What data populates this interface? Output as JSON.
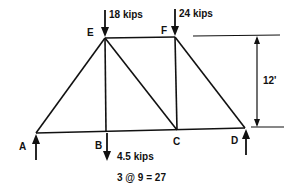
{
  "diagram": {
    "type": "truss",
    "nodes": {
      "A": {
        "label": "A"
      },
      "B": {
        "label": "B"
      },
      "C": {
        "label": "C"
      },
      "D": {
        "label": "D"
      },
      "E": {
        "label": "E"
      },
      "F": {
        "label": "F"
      }
    },
    "members": [
      "A-E",
      "E-F",
      "E-B",
      "E-C",
      "F-C",
      "F-D",
      "A-B",
      "B-C",
      "C-D"
    ],
    "loads": [
      {
        "node": "E",
        "label": "18 kips",
        "direction": "down"
      },
      {
        "node": "F",
        "label": "24 kips",
        "direction": "down"
      },
      {
        "node": "B",
        "label": "4.5 kips",
        "direction": "down"
      }
    ],
    "reactions": [
      {
        "node": "A",
        "direction": "up"
      },
      {
        "node": "D",
        "direction": "up"
      }
    ],
    "dimensions": {
      "height": "12'",
      "span": "3 @ 9 = 27"
    },
    "colors": {
      "line": "#111111",
      "background": "#ffffff"
    }
  }
}
